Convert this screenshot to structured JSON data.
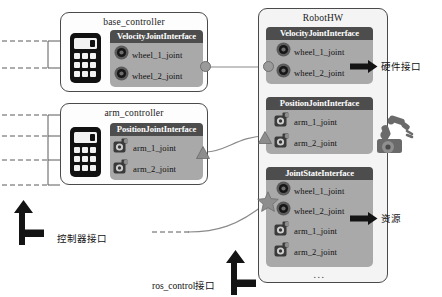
{
  "diagram": {
    "colors": {
      "iface_fill": "#a9a9a9",
      "iface_header": "#4d4d4d",
      "panel_border": "#4a4a4a",
      "robothw_fill": "#f2f2f2",
      "connector": "#9a9a9a",
      "arrow": "#141414"
    }
  },
  "base_controller": {
    "title": "base_controller",
    "icon": "calculator-icon",
    "interface": {
      "name": "VelocityJointInterface",
      "joints": [
        {
          "label": "wheel_1_joint",
          "icon": "wheel-joint-icon"
        },
        {
          "label": "wheel_2_joint",
          "icon": "wheel-joint-icon"
        }
      ]
    }
  },
  "arm_controller": {
    "title": "arm_controller",
    "icon": "calculator-icon",
    "interface": {
      "name": "PositionJointInterface",
      "joints": [
        {
          "label": "arm_1_joint",
          "icon": "arm-joint-icon"
        },
        {
          "label": "arm_2_joint",
          "icon": "arm-joint-icon"
        }
      ]
    }
  },
  "robot_hw": {
    "title": "RobotHW",
    "robot_icon": "robot-arm-icon",
    "interfaces": [
      {
        "name": "VelocityJointInterface",
        "joints": [
          {
            "label": "wheel_1_joint",
            "icon": "wheel-joint-icon"
          },
          {
            "label": "wheel_2_joint",
            "icon": "wheel-joint-icon"
          }
        ]
      },
      {
        "name": "PositionJointInterface",
        "joints": [
          {
            "label": "arm_1_joint",
            "icon": "arm-joint-icon"
          },
          {
            "label": "arm_2_joint",
            "icon": "arm-joint-icon"
          }
        ]
      },
      {
        "name": "JointStateInterface",
        "joints": [
          {
            "label": "wheel_1_joint",
            "icon": "wheel-joint-icon"
          },
          {
            "label": "wheel_2_joint",
            "icon": "wheel-joint-icon"
          },
          {
            "label": "arm_1_joint",
            "icon": "arm-joint-icon"
          },
          {
            "label": "arm_2_joint",
            "icon": "arm-joint-icon"
          }
        ],
        "more": "..."
      }
    ]
  },
  "annotations": {
    "hardware_interface": "硬件接口",
    "resource": "资源",
    "controller_interface": "控制器接口",
    "ros_control_interface": "ros_control接口"
  },
  "connectors": {
    "velocity_link": {
      "from": "base_controller",
      "to": "robot_hw",
      "glyph": "circle"
    },
    "position_link": {
      "from": "arm_controller",
      "to": "robot_hw",
      "glyph": "triangle"
    },
    "jointstate_link": {
      "from": "ros_control",
      "to": "robot_hw",
      "glyph": "star"
    }
  }
}
